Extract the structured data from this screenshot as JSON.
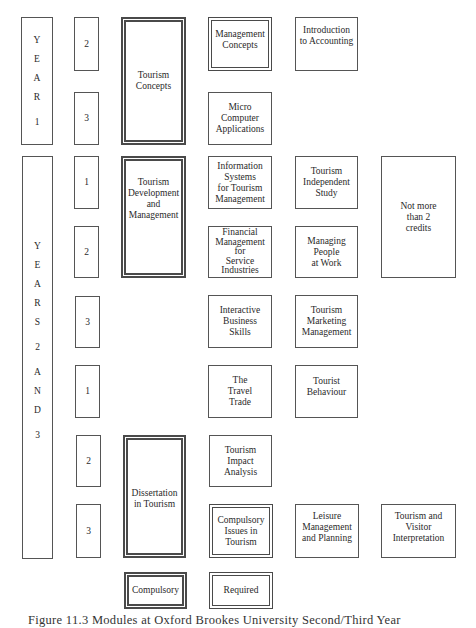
{
  "diagram": {
    "year1_label": [
      "Y",
      "E",
      "A",
      "R",
      "",
      "1"
    ],
    "years23_label": [
      "Y",
      "E",
      "A",
      "R",
      "S",
      "",
      "2",
      "",
      "A",
      "N",
      "D",
      "",
      "3"
    ],
    "terms": {
      "y1_t2": "2",
      "y1_t3": "3",
      "y2_t1": "1",
      "y2_t2": "2",
      "y2_t3": "3",
      "y3_t1": "1",
      "y3_t2": "2",
      "y3_t3": "3"
    },
    "compulsory_modules": {
      "tourism_concepts": "Tourism\nConcepts",
      "tourism_development": "Tourism\nDevelopment\nand\nManagement",
      "dissertation": "Dissertation\nin Tourism"
    },
    "required_modules": {
      "management_concepts": "Management\nConcepts",
      "compulsory_issues": "Compulsory\nIssues in\nTourism"
    },
    "modules": {
      "intro_accounting": "Introduction\nto Accounting",
      "micro_computer": "Micro\nComputer\nApplications",
      "info_systems": "Information\nSystems\nfor Tourism\nManagement",
      "independent_study": "Tourism\nIndependent\nStudy",
      "financial_mgmt": "Financial\nManagement\nfor\nService\nIndustries",
      "managing_people": "Managing\nPeople\nat Work",
      "interactive_business": "Interactive\nBusiness\nSkills",
      "tourism_marketing": "Tourism\nMarketing\nManagement",
      "travel_trade": "The\nTravel\nTrade",
      "tourist_behaviour": "Tourist\nBehaviour",
      "impact_analysis": "Tourism\nImpact\nAnalysis",
      "leisure_mgmt": "Leisure\nManagement\nand Planning",
      "visitor_interpretation": "Tourism and\nVisitor\nInterpretation"
    },
    "note": "Not more\nthan 2\ncredits",
    "legend": {
      "compulsory": "Compulsory",
      "required": "Required"
    },
    "caption": "Figure 11.3  Modules at Oxford Brookes University Second/Third Year"
  }
}
